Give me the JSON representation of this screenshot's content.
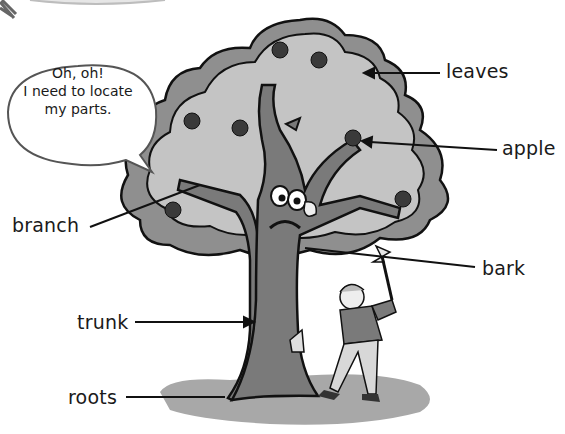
{
  "diagram": {
    "speech_bubble": {
      "lines": [
        "Oh, oh!",
        "I need to locate",
        "my parts."
      ]
    },
    "labels": [
      {
        "id": "leaves",
        "text": "leaves",
        "x": 446,
        "y": 60
      },
      {
        "id": "apple",
        "text": "apple",
        "x": 502,
        "y": 137
      },
      {
        "id": "branch",
        "text": "branch",
        "x": 12,
        "y": 214
      },
      {
        "id": "bark",
        "text": "bark",
        "x": 482,
        "y": 257
      },
      {
        "id": "trunk",
        "text": "trunk",
        "x": 77,
        "y": 311
      },
      {
        "id": "roots",
        "text": "roots",
        "x": 68,
        "y": 386
      }
    ],
    "colors": {
      "foliage_light": "#c4c4c4",
      "foliage_dark": "#8f8f8f",
      "trunk": "#7a7a7a",
      "apple": "#3a3a3a",
      "ground": "#a8a8a8",
      "outline": "#111111"
    }
  }
}
